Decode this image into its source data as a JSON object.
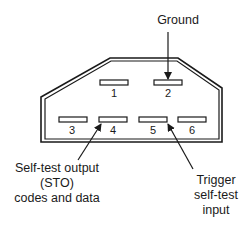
{
  "diagram": {
    "pins": [
      {
        "number": "1"
      },
      {
        "number": "2"
      },
      {
        "number": "3"
      },
      {
        "number": "4"
      },
      {
        "number": "5"
      },
      {
        "number": "6"
      }
    ],
    "callouts": {
      "ground": {
        "text": "Ground",
        "pin": "2"
      },
      "sto": {
        "lines": [
          "Self-test output",
          "(STO)",
          "codes and data"
        ],
        "pin": "4"
      },
      "trigger": {
        "lines": [
          "Trigger",
          "self-test",
          "input"
        ],
        "pin": "5"
      }
    },
    "colors": {
      "line": "#1a1a1a",
      "background": "#ffffff"
    }
  }
}
